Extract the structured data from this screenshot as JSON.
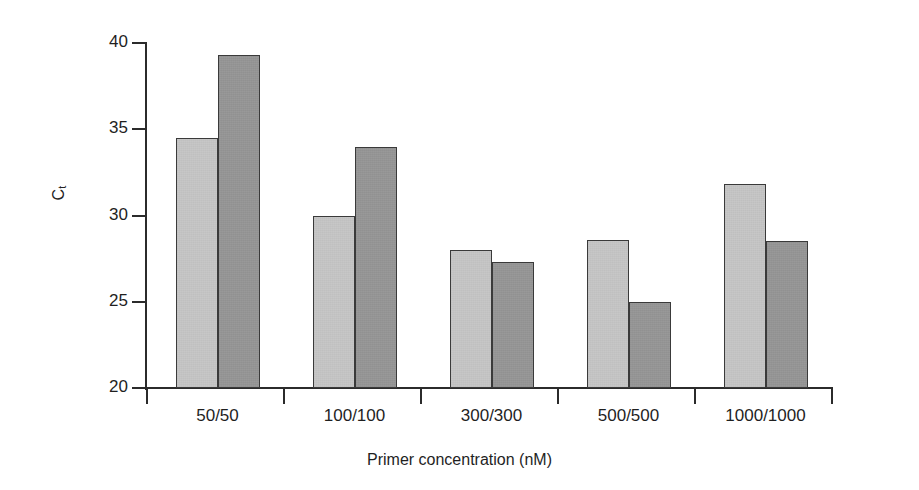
{
  "chart_data": {
    "type": "bar",
    "title": "",
    "xlabel": "Primer concentration (nM)",
    "ylabel": "Ct",
    "ylabel_base": "C",
    "ylabel_sub": "t",
    "categories": [
      "50/50",
      "100/100",
      "300/300",
      "500/500",
      "1000/1000"
    ],
    "series": [
      {
        "name": "light",
        "color": "#c6c6c6",
        "values": [
          34.5,
          30.0,
          28.0,
          28.6,
          31.8
        ]
      },
      {
        "name": "dark",
        "color": "#969696",
        "values": [
          39.3,
          34.0,
          27.3,
          25.0,
          28.5
        ]
      }
    ],
    "ylim": [
      20,
      40
    ],
    "yticks": [
      20,
      25,
      30,
      35,
      40
    ],
    "ytick_labels": [
      "20",
      "25",
      "30",
      "35",
      "40"
    ],
    "grid": false,
    "legend": "none",
    "bar_edge_color": "#3a3a3a",
    "axis_color": "#2b2b2b",
    "background": "#ffffff"
  }
}
